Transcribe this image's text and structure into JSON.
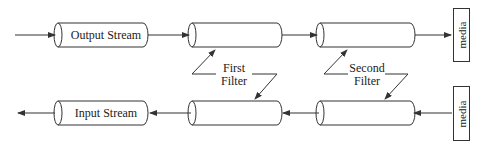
{
  "diagram": {
    "nodes": {
      "output_stream": "Output Stream",
      "input_stream": "Input Stream",
      "first_filter": "First\nFilter",
      "first_filter_line1": "First",
      "first_filter_line2": "Filter",
      "second_filter_line1": "Second",
      "second_filter_line2": "Filter",
      "media_top": "media",
      "media_bottom": "media"
    },
    "colors": {
      "stroke": "#333333",
      "background": "#ffffff",
      "text": "#222222"
    }
  }
}
